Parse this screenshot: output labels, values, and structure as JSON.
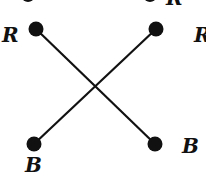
{
  "diagram": {
    "type": "crossing-graph",
    "nodes": [
      {
        "id": "top-left",
        "label": "R",
        "cx": 36,
        "cy": 29
      },
      {
        "id": "top-right",
        "label": "R",
        "cx": 156,
        "cy": 29
      },
      {
        "id": "bottom-left",
        "label": "B",
        "cx": 34,
        "cy": 144
      },
      {
        "id": "bottom-right",
        "label": "B",
        "cx": 155,
        "cy": 144
      }
    ],
    "edges": [
      {
        "from": "top-left",
        "to": "bottom-right"
      },
      {
        "from": "top-right",
        "to": "bottom-left"
      }
    ],
    "labels": {
      "top_left": "R",
      "top_right": "R",
      "bottom_left": "B",
      "bottom_right": "B",
      "top_clipped": "R"
    },
    "colors": {
      "node": "#111111",
      "edge": "#111111",
      "background": "#ffffff"
    }
  }
}
